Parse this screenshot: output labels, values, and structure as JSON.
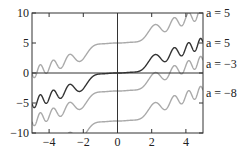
{
  "chart_data": {
    "type": "line",
    "title": "",
    "xlabel": "",
    "ylabel": "",
    "xlim": [
      -5,
      5
    ],
    "ylim": [
      -10,
      10
    ],
    "grid": false,
    "x_ticks": [
      -4,
      -2,
      0,
      2,
      4
    ],
    "x_tick_labels": [
      "−4",
      "−2",
      "0",
      "2",
      "4"
    ],
    "y_ticks": [
      -10,
      -5,
      0,
      5,
      10
    ],
    "y_tick_labels": [
      "−10",
      "−5",
      "0",
      "5",
      "10"
    ],
    "base_curve_description": "y = a + f(x), f flat near 0, f(x) ≈ x with oscillations of increasing frequency",
    "base_curve_samples": {
      "x": [
        -4.8,
        -4,
        -3,
        -2,
        -1,
        0,
        1,
        2,
        3,
        4,
        4.8
      ],
      "y": [
        -5.0,
        -4.2,
        -3.2,
        -2.0,
        -0.3,
        0,
        0.3,
        2.0,
        3.2,
        4.2,
        4.6
      ]
    },
    "series": [
      {
        "name": "a = 5",
        "offset": 5,
        "color": "#aaaaaa",
        "label_y": 10
      },
      {
        "name": "a = 5",
        "offset": 0,
        "color": "#333333",
        "label_y": 5
      },
      {
        "name": "a = −3",
        "offset": -3,
        "color": "#aaaaaa",
        "label_y": 1.5
      },
      {
        "name": "a = −8",
        "offset": -8,
        "color": "#aaaaaa",
        "label_y": -3.3
      }
    ]
  }
}
